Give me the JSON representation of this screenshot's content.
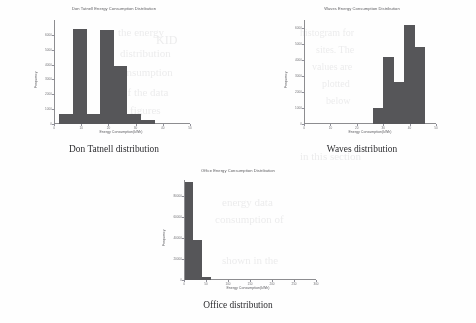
{
  "page": {
    "background_color": "#fefefe",
    "bar_color": "#565659",
    "axis_color": "#8d8d90"
  },
  "bleed_text": [
    {
      "text": "the energy",
      "x": 118,
      "y": 26,
      "size": 11,
      "rot": 0
    },
    {
      "text": "KID",
      "x": 156,
      "y": 33,
      "size": 12,
      "rot": 0
    },
    {
      "text": "distribution",
      "x": 120,
      "y": 47,
      "size": 11,
      "rot": 0
    },
    {
      "text": "consumption",
      "x": 116,
      "y": 66,
      "size": 11,
      "rot": 0
    },
    {
      "text": "of the data",
      "x": 122,
      "y": 86,
      "size": 11,
      "rot": 0
    },
    {
      "text": "figures",
      "x": 130,
      "y": 104,
      "size": 11,
      "rot": 0
    },
    {
      "text": "histogram for",
      "x": 300,
      "y": 27,
      "size": 10,
      "rot": 0
    },
    {
      "text": "sites. The",
      "x": 316,
      "y": 44,
      "size": 10,
      "rot": 0
    },
    {
      "text": "values are",
      "x": 312,
      "y": 61,
      "size": 10,
      "rot": 0
    },
    {
      "text": "plotted",
      "x": 322,
      "y": 78,
      "size": 10,
      "rot": 0
    },
    {
      "text": "below",
      "x": 326,
      "y": 95,
      "size": 10,
      "rot": 0
    },
    {
      "text": "in this section",
      "x": 300,
      "y": 150,
      "size": 11,
      "rot": 0
    },
    {
      "text": "energy data",
      "x": 222,
      "y": 196,
      "size": 11,
      "rot": 0
    },
    {
      "text": "consumption of",
      "x": 215,
      "y": 213,
      "size": 11,
      "rot": 0
    },
    {
      "text": "shown in the",
      "x": 222,
      "y": 254,
      "size": 11,
      "rot": 0
    }
  ],
  "figures": [
    {
      "id": "don-tatnell",
      "caption": "Don Tatnell distribution",
      "chart_data": {
        "type": "bar",
        "title": "Don Tatnell Energy Consumption Distribution",
        "xlabel": "Energy Consumption(kWh)",
        "ylabel": "Frequency",
        "grid": false,
        "legend": null,
        "xlim": [
          0,
          50
        ],
        "ylim": [
          0,
          7000
        ],
        "xticks": [
          "0",
          "10",
          "20",
          "30",
          "40",
          "50"
        ],
        "xtick_values": [
          0,
          10,
          20,
          30,
          40,
          50
        ],
        "yticks": [
          "0",
          "1000",
          "2000",
          "3000",
          "4000",
          "5000",
          "6000"
        ],
        "ytick_values": [
          0,
          1000,
          2000,
          3000,
          4000,
          5000,
          6000
        ],
        "bin_edges": [
          2,
          7,
          12,
          17,
          22,
          27,
          32,
          37,
          42
        ],
        "values": [
          700,
          6400,
          700,
          6350,
          3900,
          700,
          250,
          0
        ],
        "categories": [
          "2-7",
          "7-12",
          "12-17",
          "17-22",
          "22-27",
          "27-32",
          "32-37",
          "37-42"
        ]
      }
    },
    {
      "id": "waves",
      "caption": "Waves distribution",
      "chart_data": {
        "type": "bar",
        "title": "Waves Energy Consumption Distribution",
        "xlabel": "Energy Consumption(kWh)",
        "ylabel": "Frequency",
        "grid": false,
        "legend": null,
        "xlim": [
          0,
          50
        ],
        "ylim": [
          0,
          6500
        ],
        "xticks": [
          "0",
          "10",
          "20",
          "30",
          "40",
          "50"
        ],
        "xtick_values": [
          0,
          10,
          20,
          30,
          40,
          50
        ],
        "yticks": [
          "0",
          "1000",
          "2000",
          "3000",
          "4000",
          "5000",
          "6000"
        ],
        "ytick_values": [
          0,
          1000,
          2000,
          3000,
          4000,
          5000,
          6000
        ],
        "bin_edges": [
          26,
          30,
          34,
          38,
          42,
          46
        ],
        "values": [
          1000,
          4200,
          2600,
          6200,
          4800
        ],
        "categories": [
          "26-30",
          "30-34",
          "34-38",
          "38-42",
          "42-46"
        ]
      }
    },
    {
      "id": "office",
      "caption": "Office distribution",
      "chart_data": {
        "type": "bar",
        "title": "Office Energy Consumption Distribution",
        "xlabel": "Energy Consumption(kWh)",
        "ylabel": "Frequency",
        "grid": false,
        "legend": null,
        "xlim": [
          0,
          300
        ],
        "ylim": [
          0,
          95000
        ],
        "xticks": [
          "0",
          "50",
          "100",
          "150",
          "200",
          "250",
          "300"
        ],
        "xtick_values": [
          0,
          50,
          100,
          150,
          200,
          250,
          300
        ],
        "yticks": [
          "0",
          "20000",
          "40000",
          "60000",
          "80000",
          "100000",
          "120000",
          "140000"
        ],
        "ytick_values": [
          0,
          20000,
          40000,
          60000,
          80000,
          100000,
          120000,
          140000
        ],
        "bin_edges": [
          2,
          20,
          42,
          62
        ],
        "values": [
          93000,
          38000,
          2500
        ],
        "categories": [
          "2-20",
          "20-42",
          "42-62"
        ]
      }
    }
  ]
}
